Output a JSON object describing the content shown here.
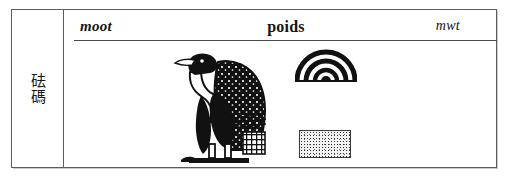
{
  "entry": {
    "label_cell": {
      "cjk_text": "砝碼"
    },
    "headers": {
      "transliteration_left": "moot",
      "translation_center": "poids",
      "transliteration_right": "mwt"
    },
    "glyphs": [
      {
        "name": "vulture-hieroglyph",
        "gardiner": "G14"
      },
      {
        "name": "nested-arc-hieroglyph"
      },
      {
        "name": "stippled-rectangle-hieroglyph"
      }
    ],
    "colors": {
      "frame": "#5d5d5d",
      "rule": "#4a4a4a",
      "ink": "#141414",
      "page": "#ffffff"
    }
  }
}
